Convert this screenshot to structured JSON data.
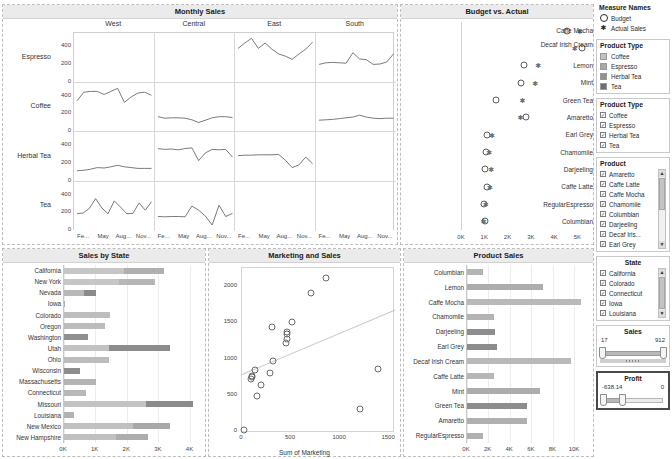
{
  "monthly": {
    "title": "Monthly Sales",
    "columns": [
      "West",
      "Central",
      "East",
      "South"
    ],
    "rows": [
      "Espresso",
      "Coffee",
      "Herbal Tea",
      "Tea"
    ],
    "y_ticks": [
      "400",
      "200",
      "0"
    ],
    "x_ticks": [
      "Fe...",
      "May",
      "Aug...",
      "Nov..."
    ],
    "ylim": [
      0,
      560
    ],
    "series": {
      "Espresso": {
        "West": [],
        "Central": [],
        "East": [
          400,
          470,
          530,
          400,
          470,
          390,
          330,
          300,
          260,
          330,
          390,
          480
        ],
        "South": [
          195,
          215,
          220,
          215,
          210,
          345,
          265,
          255,
          195,
          200,
          225,
          330
        ]
      },
      "Coffee": {
        "West": [
          370,
          480,
          490,
          490,
          450,
          490,
          530,
          350,
          420,
          470,
          480,
          440
        ],
        "Central": [
          165,
          145,
          150,
          150,
          145,
          125,
          90,
          120,
          150,
          165,
          165,
          155
        ],
        "East": [],
        "South": [
          120,
          125,
          130,
          140,
          150,
          160,
          185,
          160,
          145,
          140,
          145,
          145
        ]
      },
      "Herbal Tea": {
        "West": [
          100,
          105,
          120,
          140,
          135,
          150,
          170,
          150,
          140,
          130,
          130,
          130
        ],
        "Central": [
          385,
          375,
          380,
          370,
          385,
          395,
          230,
          330,
          375,
          370,
          375,
          275
        ],
        "East": [
          295,
          300,
          300,
          305,
          305,
          305,
          310,
          235,
          140,
          175,
          275,
          190
        ],
        "South": []
      },
      "Tea": {
        "West": [
          190,
          200,
          260,
          385,
          265,
          190,
          355,
          275,
          190,
          195,
          330,
          235,
          345
        ],
        "Central": [
          155,
          150,
          155,
          155,
          150,
          290,
          235,
          160,
          45,
          300,
          155,
          195
        ],
        "East": [],
        "South": []
      }
    }
  },
  "budget": {
    "title": "Budget vs. Actual",
    "x_ticks": [
      "0K",
      "1K",
      "2K",
      "3K",
      "4K",
      "5K"
    ],
    "xlim": [
      0,
      5500
    ],
    "rows": [
      {
        "label": "Caffe Mocha",
        "budget": 4550,
        "actual": 5100
      },
      {
        "label": "Decaf Irish Cream",
        "budget": 5200,
        "actual": 4880
      },
      {
        "label": "Lemon",
        "budget": 2680,
        "actual": 3300
      },
      {
        "label": "Mint",
        "budget": 2560,
        "actual": 3170
      },
      {
        "label": "Green Tea",
        "budget": 1470,
        "actual": 2620
      },
      {
        "label": "Amaretto",
        "budget": 2750,
        "actual": 2530
      },
      {
        "label": "Earl Grey",
        "budget": 1070,
        "actual": 1300
      },
      {
        "label": "Chamomile",
        "budget": 1060,
        "actual": 1180
      },
      {
        "label": "Darjeeling",
        "budget": 980,
        "actual": 1260
      },
      {
        "label": "Caffe Latte",
        "budget": 1070,
        "actual": 1210
      },
      {
        "label": "RegularEspresso",
        "budget": 960,
        "actual": 1030
      },
      {
        "label": "Columbian",
        "budget": 990,
        "actual": 940
      }
    ]
  },
  "sidebar": {
    "measure_names": {
      "title": "Measure Names",
      "items": [
        {
          "label": "Budget",
          "marker": "circle-marker"
        },
        {
          "label": "Actual Sales",
          "marker": "asterisk-marker"
        }
      ]
    },
    "product_type_legend": {
      "title": "Product Type",
      "items": [
        {
          "label": "Coffee",
          "color": "#c0c0c0"
        },
        {
          "label": "Espresso",
          "color": "#a8a8a8"
        },
        {
          "label": "Herbal Tea",
          "color": "#919191"
        },
        {
          "label": "Tea",
          "color": "#6e6e6e"
        }
      ]
    },
    "product_type_filter": {
      "title": "Product Type",
      "items": [
        "Coffee",
        "Espresso",
        "Herbal Tea",
        "Tea"
      ],
      "checked": true
    },
    "product_filter": {
      "title": "Product",
      "items": [
        "Amaretto",
        "Caffe Latte",
        "Caffe Mocha",
        "Chamomile",
        "Columbian",
        "Darjeeling",
        "Decaf Iris...",
        "Earl Grey"
      ],
      "checked": true,
      "scroll_up": "▲",
      "scroll_down": "▼"
    },
    "state_filter": {
      "title": "State",
      "items": [
        "California",
        "Colorado",
        "Connecticut",
        "Iowa",
        "Louisiana"
      ],
      "checked": true,
      "scroll_up": "▲",
      "scroll_down": "▼"
    },
    "sales_slider": {
      "title": "Sales",
      "min_label": "17",
      "max_label": "912",
      "left_pct": 0,
      "right_pct": 100
    },
    "profit_slider": {
      "title": "Profit",
      "min_label": "-638.14",
      "max_label": "0",
      "left_pct": 0,
      "right_pct": 38,
      "selected": true
    }
  },
  "state_chart": {
    "title": "Sales by State",
    "x_ticks": [
      "0K",
      "1K",
      "2K",
      "3K",
      "4K"
    ],
    "xlim": [
      0,
      4300
    ],
    "rows": [
      {
        "label": "California",
        "segments": [
          {
            "value": 1900,
            "color": "#c6c6c6"
          },
          {
            "value": 1300,
            "color": "#b0b0b0"
          }
        ]
      },
      {
        "label": "New York",
        "segments": [
          {
            "value": 1750,
            "color": "#c6c6c6"
          },
          {
            "value": 1150,
            "color": "#b6b6b6"
          }
        ]
      },
      {
        "label": "Nevada",
        "segments": [
          {
            "value": 640,
            "color": "#b8b8b8"
          },
          {
            "value": 380,
            "color": "#8a8a8a"
          }
        ]
      },
      {
        "label": "Iowa",
        "segments": [
          {
            "value": 45,
            "color": "#b0b0b0"
          }
        ]
      },
      {
        "label": "Colorado",
        "segments": [
          {
            "value": 1460,
            "color": "#bdbdbd"
          }
        ]
      },
      {
        "label": "Oregon",
        "segments": [
          {
            "value": 1320,
            "color": "#bcbcbc"
          }
        ]
      },
      {
        "label": "Washington",
        "segments": [
          {
            "value": 770,
            "color": "#8f8f8f"
          }
        ]
      },
      {
        "label": "Utah",
        "segments": [
          {
            "value": 1420,
            "color": "#c2c2c2"
          },
          {
            "value": 1950,
            "color": "#8c8c8c"
          }
        ]
      },
      {
        "label": "Ohio",
        "segments": [
          {
            "value": 1420,
            "color": "#bdbdbd"
          }
        ]
      },
      {
        "label": "Wisconsin",
        "segments": [
          {
            "value": 520,
            "color": "#8d8d8d"
          }
        ]
      },
      {
        "label": "Massachusetts",
        "segments": [
          {
            "value": 1030,
            "color": "#b4b4b4"
          }
        ]
      },
      {
        "label": "Connecticut",
        "segments": [
          {
            "value": 700,
            "color": "#b8b8b8"
          }
        ]
      },
      {
        "label": "Missouri",
        "segments": [
          {
            "value": 2600,
            "color": "#c3c3c3"
          },
          {
            "value": 1500,
            "color": "#8b8b8b"
          }
        ]
      },
      {
        "label": "Louisiana",
        "segments": [
          {
            "value": 330,
            "color": "#b2b2b2"
          }
        ]
      },
      {
        "label": "New Mexico",
        "segments": [
          {
            "value": 2200,
            "color": "#c0c0c0"
          },
          {
            "value": 1180,
            "color": "#a8a8a8"
          }
        ]
      },
      {
        "label": "New Hampshire",
        "segments": [
          {
            "value": 1650,
            "color": "#c0c0c0"
          },
          {
            "value": 1030,
            "color": "#adadad"
          }
        ]
      }
    ]
  },
  "scatter": {
    "title": "Marketing and Sales",
    "xlabel": "Sum of Marketing",
    "x_ticks": [
      "0",
      "500",
      "1000",
      "1500"
    ],
    "y_ticks": [
      "0",
      "500",
      "1000",
      "1500",
      "2000"
    ],
    "xlim": [
      0,
      1560
    ],
    "ylim": [
      0,
      2250
    ],
    "points": [
      {
        "x": 20,
        "y": 20
      },
      {
        "x": 95,
        "y": 720
      },
      {
        "x": 100,
        "y": 745
      },
      {
        "x": 105,
        "y": 765
      },
      {
        "x": 130,
        "y": 840
      },
      {
        "x": 150,
        "y": 490
      },
      {
        "x": 195,
        "y": 640
      },
      {
        "x": 285,
        "y": 800
      },
      {
        "x": 305,
        "y": 1430
      },
      {
        "x": 320,
        "y": 960
      },
      {
        "x": 455,
        "y": 1215
      },
      {
        "x": 462,
        "y": 1270
      },
      {
        "x": 468,
        "y": 1340
      },
      {
        "x": 470,
        "y": 1365
      },
      {
        "x": 520,
        "y": 1510
      },
      {
        "x": 715,
        "y": 1905
      },
      {
        "x": 870,
        "y": 2110
      },
      {
        "x": 1215,
        "y": 310
      },
      {
        "x": 1405,
        "y": 850
      }
    ],
    "trend": {
      "x1": 0,
      "y1": 790,
      "x2": 1560,
      "y2": 1680
    }
  },
  "product_sales": {
    "title": "Product Sales",
    "x_ticks": [
      "0K",
      "2K",
      "4K",
      "6K",
      "8K",
      "10K"
    ],
    "xlim": [
      0,
      11200
    ],
    "rows": [
      {
        "label": "Columbian",
        "value": 1450,
        "color": "#b4b4b4"
      },
      {
        "label": "Lemon",
        "value": 7050,
        "color": "#adadad"
      },
      {
        "label": "Caffe Mocha",
        "value": 10650,
        "color": "#b9b9b9"
      },
      {
        "label": "Chamomile",
        "value": 2550,
        "color": "#b3b3b3"
      },
      {
        "label": "Darjeeling",
        "value": 2600,
        "color": "#8e8e8e"
      },
      {
        "label": "Earl Grey",
        "value": 2780,
        "color": "#8c8c8c"
      },
      {
        "label": "Decaf Irish Cream",
        "value": 9700,
        "color": "#b9b9b9"
      },
      {
        "label": "Caffe Latte",
        "value": 2520,
        "color": "#b6b6b6"
      },
      {
        "label": "Mint",
        "value": 6850,
        "color": "#adadad"
      },
      {
        "label": "Green Tea",
        "value": 5620,
        "color": "#8d8d8d"
      },
      {
        "label": "Amaretto",
        "value": 5560,
        "color": "#b0b0b0"
      },
      {
        "label": "RegularEspresso",
        "value": 1500,
        "color": "#b0b0b0"
      }
    ]
  }
}
